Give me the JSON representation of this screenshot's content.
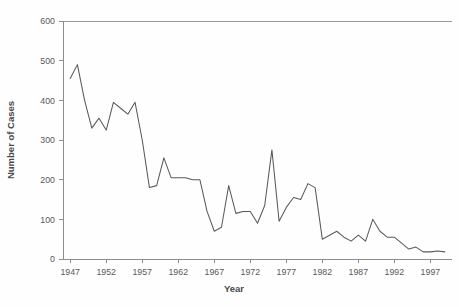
{
  "chart_data": {
    "type": "line",
    "title": "",
    "xlabel": "Year",
    "ylabel": "Number of Cases",
    "xlim": [
      1946,
      2000
    ],
    "ylim": [
      0,
      600
    ],
    "grid": false,
    "legend": "none",
    "y_ticks": [
      0,
      100,
      200,
      300,
      400,
      500,
      600
    ],
    "y_tick_labels": [
      "0",
      "100",
      "200",
      "300",
      "400",
      "500",
      "600"
    ],
    "x_ticks": [
      1947,
      1952,
      1957,
      1962,
      1967,
      1972,
      1977,
      1982,
      1987,
      1992,
      1997
    ],
    "x_tick_labels": [
      "1947",
      "1952",
      "1957",
      "1962",
      "1967",
      "1972",
      "1977",
      "1982",
      "1987",
      "1992",
      "1997"
    ],
    "x": [
      1947,
      1948,
      1949,
      1950,
      1951,
      1952,
      1953,
      1954,
      1955,
      1956,
      1957,
      1958,
      1959,
      1960,
      1961,
      1962,
      1963,
      1964,
      1965,
      1966,
      1967,
      1968,
      1969,
      1970,
      1971,
      1972,
      1973,
      1974,
      1975,
      1976,
      1977,
      1978,
      1979,
      1980,
      1981,
      1982,
      1983,
      1984,
      1985,
      1986,
      1987,
      1988,
      1989,
      1990,
      1991,
      1992,
      1993,
      1994,
      1995,
      1996,
      1997,
      1998,
      1999
    ],
    "values": [
      455,
      490,
      400,
      330,
      355,
      325,
      395,
      380,
      365,
      395,
      300,
      180,
      185,
      255,
      205,
      205,
      205,
      200,
      200,
      120,
      70,
      80,
      185,
      115,
      120,
      120,
      90,
      135,
      275,
      95,
      130,
      155,
      150,
      190,
      180,
      50,
      60,
      70,
      55,
      45,
      60,
      45,
      100,
      70,
      55,
      55,
      40,
      25,
      30,
      18,
      18,
      20,
      18
    ],
    "series_name": "Number of Cases",
    "line_color": "#5a5a5a"
  }
}
